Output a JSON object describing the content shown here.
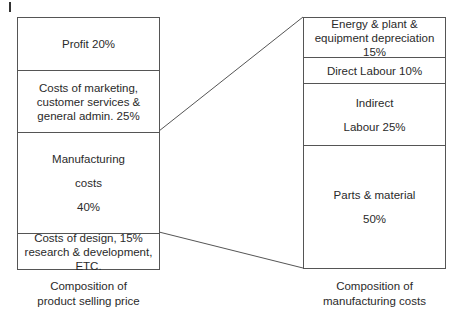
{
  "left_stack": {
    "caption_line1": "Composition of",
    "caption_line2": "product selling price",
    "segments": [
      {
        "lines": [
          "Profit 20%"
        ]
      },
      {
        "lines": [
          "Costs of marketing,",
          "customer services &",
          "general admin. 25%"
        ]
      },
      {
        "lines": [
          "Manufacturing",
          "costs",
          "40%"
        ]
      },
      {
        "lines": [
          "Costs of design, 15%",
          "research & development, ETC."
        ]
      }
    ]
  },
  "right_stack": {
    "caption_line1": "Composition of",
    "caption_line2": "manufacturing costs",
    "segments": [
      {
        "lines": [
          "Energy & plant &",
          "equipment depreciation 15%"
        ]
      },
      {
        "lines": [
          "Direct Labour 10%"
        ]
      },
      {
        "lines": [
          "Indirect",
          "Labour 25%"
        ]
      },
      {
        "lines": [
          "Parts & material",
          "50%"
        ]
      }
    ]
  },
  "colors": {
    "line": "#555555",
    "text": "#2a2a2a",
    "background": "#ffffff"
  }
}
